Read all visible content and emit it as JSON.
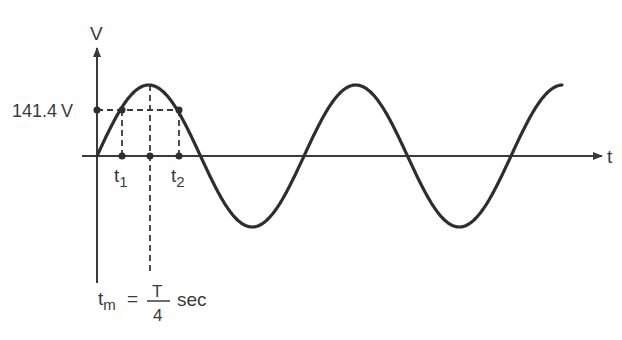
{
  "diagram": {
    "type": "sine-wave-voltage",
    "axes": {
      "y_label": "V",
      "x_label": "t"
    },
    "annotations": {
      "level_value": "141.4",
      "level_unit": "V",
      "t1_base": "t",
      "t1_sub": "1",
      "t2_base": "t",
      "t2_sub": "2",
      "tm_base": "t",
      "tm_sub": "m",
      "equals": "=",
      "frac_num": "T",
      "frac_den": "4",
      "unit": "sec"
    },
    "colors": {
      "curve": "#2e2e2e",
      "axis": "#3a3a3a",
      "text": "#3a3a3a",
      "background": "#ffffff"
    },
    "cycles_shown": 2.25
  }
}
